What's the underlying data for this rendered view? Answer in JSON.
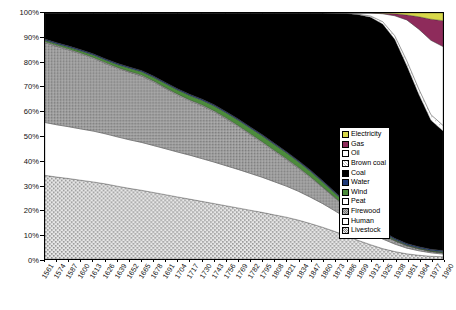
{
  "chart_data": {
    "type": "area",
    "title": "",
    "subtitle": "",
    "xlabel": "",
    "ylabel": "",
    "ylim": [
      0,
      100
    ],
    "ytick_labels": [
      "0%",
      "10%",
      "20%",
      "30%",
      "40%",
      "50%",
      "60%",
      "70%",
      "80%",
      "90%",
      "100%"
    ],
    "ytick_values": [
      0,
      10,
      20,
      30,
      40,
      50,
      60,
      70,
      80,
      90,
      100
    ],
    "grid": false,
    "stacked_percent": true,
    "legend_position": "inside-right",
    "x": [
      1561,
      1574,
      1587,
      1600,
      1613,
      1626,
      1639,
      1652,
      1665,
      1678,
      1691,
      1704,
      1717,
      1730,
      1743,
      1756,
      1769,
      1782,
      1795,
      1808,
      1821,
      1834,
      1847,
      1860,
      1873,
      1886,
      1899,
      1912,
      1925,
      1938,
      1951,
      1964,
      1977,
      1990
    ],
    "xtick_labels": [
      "1561",
      "1574",
      "1587",
      "1600",
      "1613",
      "1626",
      "1639",
      "1652",
      "1665",
      "1678",
      "1691",
      "1704",
      "1717",
      "1730",
      "1743",
      "1756",
      "1769",
      "1782",
      "1795",
      "1808",
      "1821",
      "1834",
      "1847",
      "1860",
      "1873",
      "1886",
      "1899",
      "1912",
      "1925",
      "1938",
      "1951",
      "1964",
      "1977",
      "1990"
    ],
    "series": [
      {
        "name": "Livestock",
        "color": "#d9d9d9",
        "pattern": "fine-dot",
        "values": [
          34,
          33.4,
          32.8,
          32.1,
          31.4,
          30.6,
          29.7,
          28.8,
          28.0,
          27.1,
          26.2,
          25.3,
          24.4,
          23.5,
          22.6,
          21.7,
          20.8,
          19.9,
          19.0,
          18.0,
          17.0,
          15.8,
          14.4,
          12.9,
          11.2,
          9.4,
          7.5,
          5.8,
          4.2,
          3.0,
          2.1,
          1.5,
          1.1,
          0.9
        ]
      },
      {
        "name": "Human",
        "color": "#ffffff",
        "pattern": "solid",
        "values": [
          21.5,
          21.3,
          21.1,
          20.9,
          20.7,
          20.4,
          20.1,
          19.8,
          19.5,
          19.1,
          18.7,
          18.3,
          17.9,
          17.4,
          16.9,
          16.3,
          15.7,
          15.0,
          14.3,
          13.5,
          12.6,
          11.7,
          10.7,
          9.6,
          8.4,
          7.2,
          6.0,
          4.9,
          3.9,
          3.0,
          2.3,
          1.8,
          1.4,
          1.1
        ]
      },
      {
        "name": "Firewood",
        "color": "#9a9a9a",
        "pattern": "cross-hatch",
        "values": [
          32.5,
          32.0,
          31.3,
          30.6,
          29.7,
          28.7,
          28.0,
          27.6,
          27.1,
          26.0,
          24.6,
          23.3,
          22.2,
          21.6,
          20.6,
          19.2,
          17.6,
          15.9,
          14.2,
          12.5,
          10.9,
          9.4,
          8.0,
          6.6,
          5.3,
          4.2,
          3.2,
          2.4,
          1.8,
          1.3,
          1.0,
          0.8,
          0.6,
          0.5
        ]
      },
      {
        "name": "Peat",
        "color": "#ffffff",
        "pattern": "solid",
        "values": [
          0.3,
          0.3,
          0.3,
          0.3,
          0.3,
          0.3,
          0.3,
          0.3,
          0.3,
          0.3,
          0.3,
          0.3,
          0.3,
          0.3,
          0.3,
          0.3,
          0.3,
          0.3,
          0.3,
          0.3,
          0.3,
          0.3,
          0.3,
          0.2,
          0.2,
          0.2,
          0.15,
          0.1,
          0.1,
          0.1,
          0.05,
          0.05,
          0.05,
          0.05
        ]
      },
      {
        "name": "Wind",
        "color": "#4b8b3b",
        "pattern": "solid",
        "values": [
          0.6,
          0.7,
          0.8,
          0.9,
          1.0,
          1.1,
          1.2,
          1.3,
          1.4,
          1.5,
          1.6,
          1.7,
          1.8,
          1.9,
          2.0,
          2.1,
          2.2,
          2.3,
          2.4,
          2.4,
          2.4,
          2.3,
          2.2,
          2.0,
          1.7,
          1.4,
          1.1,
          0.8,
          0.6,
          0.4,
          0.3,
          0.3,
          0.3,
          0.4
        ]
      },
      {
        "name": "Water",
        "color": "#1f3a7a",
        "pattern": "solid",
        "values": [
          0.5,
          0.5,
          0.5,
          0.5,
          0.5,
          0.5,
          0.5,
          0.5,
          0.5,
          0.5,
          0.5,
          0.5,
          0.5,
          0.5,
          0.5,
          0.5,
          0.5,
          0.5,
          0.5,
          0.5,
          0.5,
          0.5,
          0.5,
          0.5,
          0.5,
          0.5,
          0.5,
          0.5,
          0.5,
          0.5,
          0.5,
          0.5,
          0.5,
          0.5
        ]
      },
      {
        "name": "Coal",
        "color": "#000000",
        "pattern": "solid",
        "values": [
          10.6,
          12.1,
          13.5,
          15.0,
          16.6,
          18.6,
          20.5,
          22.0,
          23.4,
          25.7,
          28.3,
          30.9,
          33.1,
          35.0,
          37.3,
          40.1,
          43.1,
          46.3,
          49.5,
          53.0,
          56.2,
          59.8,
          63.7,
          67.9,
          72.2,
          76.5,
          80.6,
          83.5,
          84.0,
          80.0,
          72.0,
          61.0,
          52.0,
          48.5
        ]
      },
      {
        "name": "Brown coal",
        "color": "#ffffff",
        "pattern": "light-hatch",
        "values": [
          0,
          0,
          0,
          0,
          0,
          0,
          0,
          0,
          0,
          0,
          0,
          0,
          0,
          0,
          0,
          0,
          0,
          0,
          0,
          0,
          0,
          0,
          0,
          0,
          0,
          0,
          0.2,
          0.5,
          1.0,
          1.5,
          2.0,
          2.2,
          2.3,
          2.3
        ]
      },
      {
        "name": "Oil",
        "color": "#ffffff",
        "pattern": "solid",
        "values": [
          0,
          0,
          0,
          0,
          0,
          0,
          0,
          0,
          0,
          0,
          0,
          0,
          0,
          0,
          0,
          0,
          0,
          0,
          0,
          0,
          0,
          0,
          0,
          0,
          0.1,
          0.2,
          0.5,
          1.2,
          3.2,
          8.0,
          16.5,
          24.0,
          30.0,
          32.0
        ]
      },
      {
        "name": "Gas",
        "color": "#8e2b5b",
        "pattern": "solid",
        "values": [
          0,
          0,
          0,
          0,
          0,
          0,
          0,
          0,
          0,
          0,
          0,
          0,
          0,
          0,
          0,
          0,
          0,
          0,
          0,
          0,
          0,
          0,
          0,
          0,
          0,
          0,
          0,
          0,
          0.2,
          0.8,
          2.0,
          5.0,
          8.5,
          10.5
        ]
      },
      {
        "name": "Electricity",
        "color": "#d8d84a",
        "pattern": "solid",
        "values": [
          0,
          0,
          0,
          0,
          0,
          0,
          0,
          0,
          0,
          0,
          0,
          0,
          0,
          0,
          0,
          0,
          0,
          0,
          0,
          0,
          0,
          0,
          0,
          0,
          0,
          0,
          0,
          0,
          0.1,
          0.3,
          0.8,
          1.5,
          2.5,
          3.1
        ]
      }
    ],
    "legend_entries": [
      {
        "label": "Electricity",
        "color": "#d8d84a",
        "pattern": "solid"
      },
      {
        "label": "Gas",
        "color": "#8e2b5b",
        "pattern": "solid"
      },
      {
        "label": "Oil",
        "color": "#ffffff",
        "pattern": "solid"
      },
      {
        "label": "Brown coal",
        "color": "#ffffff",
        "pattern": "light-hatch"
      },
      {
        "label": "Coal",
        "color": "#000000",
        "pattern": "solid"
      },
      {
        "label": "Water",
        "color": "#1f3a7a",
        "pattern": "solid"
      },
      {
        "label": "Wind",
        "color": "#4b8b3b",
        "pattern": "solid"
      },
      {
        "label": "Peat",
        "color": "#ffffff",
        "pattern": "solid"
      },
      {
        "label": "Firewood",
        "color": "#9a9a9a",
        "pattern": "cross-hatch"
      },
      {
        "label": "Human",
        "color": "#ffffff",
        "pattern": "solid"
      },
      {
        "label": "Livestock",
        "color": "#d9d9d9",
        "pattern": "fine-dot"
      }
    ]
  }
}
